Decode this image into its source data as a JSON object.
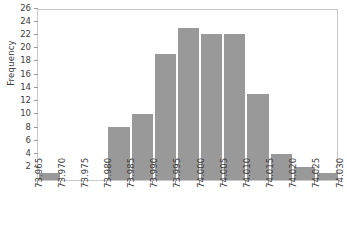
{
  "chart_data": {
    "type": "bar",
    "title": "",
    "subtitle": "",
    "xlabel": "",
    "ylabel": "Frequency",
    "grid": false,
    "legend": false,
    "legend_position": "none",
    "bar_color": "#999999",
    "bar_edge_color": "#ffffff",
    "axis_color": "#c9c9c9",
    "text_color": "#3c3c3c",
    "xlim": [
      73.965,
      74.03
    ],
    "ylim": [
      0,
      26
    ],
    "x_tick_labels": [
      "73.965",
      "73.970",
      "73.975",
      "73.980",
      "73.985",
      "73.990",
      "73.995",
      "74.000",
      "74.005",
      "74.010",
      "74.015",
      "74.020",
      "74.025",
      "74.030"
    ],
    "x_tick_values": [
      73.965,
      73.97,
      73.975,
      73.98,
      73.985,
      73.99,
      73.995,
      74.0,
      74.005,
      74.01,
      74.015,
      74.02,
      74.025,
      74.03
    ],
    "y_tick_labels": [
      "2",
      "4",
      "6",
      "8",
      "10",
      "12",
      "14",
      "16",
      "18",
      "20",
      "22",
      "24",
      "26"
    ],
    "y_tick_values": [
      2,
      4,
      6,
      8,
      10,
      12,
      14,
      16,
      18,
      20,
      22,
      24,
      26
    ],
    "bin_width": 0.005,
    "bin_edges": [
      73.965,
      73.97,
      73.975,
      73.98,
      73.985,
      73.99,
      73.995,
      74.0,
      74.005,
      74.01,
      74.015,
      74.02,
      74.025,
      74.03
    ],
    "categories": [
      "73.965-73.970",
      "73.970-73.975",
      "73.975-73.980",
      "73.980-73.985",
      "73.985-73.990",
      "73.990-73.995",
      "73.995-74.000",
      "74.000-74.005",
      "74.005-74.010",
      "74.010-74.015",
      "74.015-74.020",
      "74.020-74.025",
      "74.025-74.030"
    ],
    "values": [
      1,
      0,
      0,
      8,
      10,
      19,
      23,
      22,
      22,
      13,
      4,
      2,
      1
    ]
  }
}
